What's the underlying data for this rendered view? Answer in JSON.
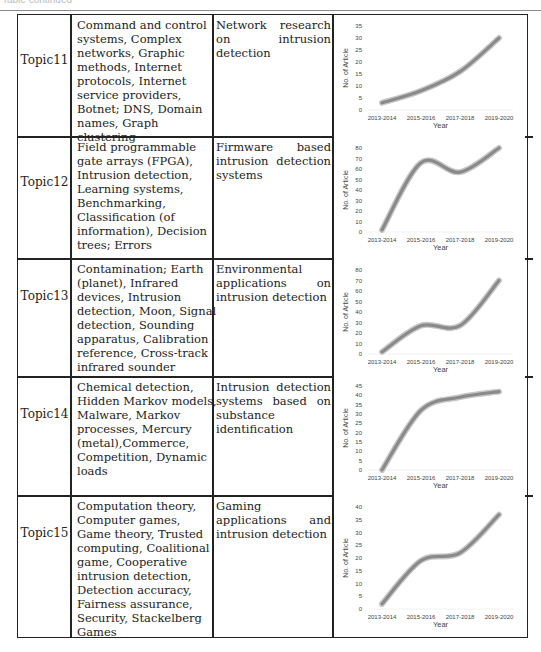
{
  "page": {
    "header_faint_text": "Table continued",
    "rows": [
      {
        "topic": "Topic11",
        "keywords": "Command and control systems, Complex networks, Graphic methods, Internet protocols, Internet service providers, Botnet; DNS, Domain names, Graph clustering",
        "application": "Network research on intrusion detection"
      },
      {
        "topic": "Topic12",
        "keywords": "Field programmable gate arrays (FPGA), Intrusion detection, Learning systems, Benchmarking, Classification (of information), Decision trees; Errors",
        "application": "Firmware based intrusion detection systems"
      },
      {
        "topic": "Topic13",
        "keywords": "Contamination; Earth (planet), Infrared devices, Intrusion detection, Moon, Signal detection, Sounding apparatus, Calibration reference, Cross-track infrared sounder",
        "application": "Environmental applications on intrusion detection"
      },
      {
        "topic": "Topic14",
        "keywords": "Chemical detection, Hidden Markov models, Malware, Markov processes, Mercury (metal),Commerce, Competition, Dynamic loads",
        "application": "Intrusion detection systems based on substance identification"
      },
      {
        "topic": "Topic15",
        "keywords": "Computation theory, Computer games, Game theory, Trusted computing, Coalitional game, Cooperative intrusion detection, Detection accuracy, Fairness assurance, Security, Stackelberg Games",
        "application": "Gaming applications and intrusion detection"
      }
    ]
  },
  "chart_data": [
    {
      "type": "line",
      "title": "Topic11",
      "categories": [
        "2013-2014",
        "2015-2016",
        "2017-2018",
        "2019-2020"
      ],
      "values": [
        3,
        8,
        16,
        30
      ],
      "xlabel": "Year",
      "ylabel": "No. of Article",
      "ylim": [
        0,
        35
      ],
      "yticks": [
        0,
        5,
        10,
        15,
        20,
        25,
        30,
        35
      ],
      "grid": false,
      "smooth": true
    },
    {
      "type": "line",
      "title": "Topic12",
      "categories": [
        "2013-2014",
        "2015-2016",
        "2017-2018",
        "2019-2020"
      ],
      "values": [
        2,
        66,
        57,
        80
      ],
      "xlabel": "Year",
      "ylabel": "No. of Article",
      "ylim": [
        0,
        80
      ],
      "yticks": [
        0,
        10,
        20,
        30,
        40,
        50,
        60,
        70,
        80
      ],
      "grid": false,
      "smooth": true
    },
    {
      "type": "line",
      "title": "Topic13",
      "categories": [
        "2013-2014",
        "2015-2016",
        "2017-2018",
        "2019-2020"
      ],
      "values": [
        2,
        27,
        27,
        70
      ],
      "xlabel": "Year",
      "ylabel": "No. of Article",
      "ylim": [
        0,
        80
      ],
      "yticks": [
        0,
        10,
        20,
        30,
        40,
        50,
        60,
        70,
        80
      ],
      "grid": false,
      "smooth": true
    },
    {
      "type": "line",
      "title": "Topic14",
      "categories": [
        "2013-2014",
        "2015-2016",
        "2017-2018",
        "2019-2020"
      ],
      "values": [
        0,
        32,
        39,
        42
      ],
      "xlabel": "Year",
      "ylabel": "No. of Article",
      "ylim": [
        0,
        45
      ],
      "yticks": [
        0,
        5,
        10,
        15,
        20,
        25,
        30,
        35,
        40,
        45
      ],
      "grid": false,
      "smooth": true
    },
    {
      "type": "line",
      "title": "Topic15",
      "categories": [
        "2013-2014",
        "2015-2016",
        "2017-2018",
        "2019-2020"
      ],
      "values": [
        2,
        19,
        22,
        37
      ],
      "xlabel": "Year",
      "ylabel": "No. of Article",
      "ylim": [
        0,
        40
      ],
      "yticks": [
        0,
        5,
        10,
        15,
        20,
        25,
        30,
        35,
        40
      ],
      "grid": false,
      "smooth": true
    }
  ]
}
